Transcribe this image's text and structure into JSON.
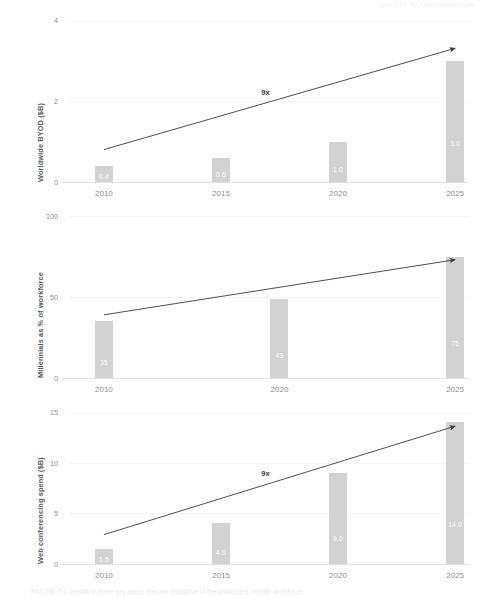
{
  "header": {
    "text": "DIGITAL TRANSFORMATION"
  },
  "caption": {
    "label": "FIGURE 7.1",
    "text": "FIGURE 7.1 Growth in three key areas that are indicative of the connected, mobile workforce."
  },
  "chart_data": [
    {
      "type": "bar",
      "title": "",
      "ylabel": "Worldwide BYOD ($B)",
      "xlabel": "",
      "categories": [
        "2010",
        "2015",
        "2020",
        "2025"
      ],
      "values": [
        0.4,
        0.6,
        1.0,
        3.0
      ],
      "value_labels": [
        "0.4",
        "0.6",
        "1.0",
        "3.0"
      ],
      "ylim": [
        0,
        4
      ],
      "yticks": [
        0,
        2,
        4
      ],
      "ytick_labels": [
        "0",
        "2",
        "4"
      ],
      "grid": true,
      "legend": "none",
      "annotation": {
        "label": "9x",
        "start": {
          "x": "2010",
          "y": 0.8
        },
        "end": {
          "x": "2025",
          "y": 3.3
        },
        "arrow": true
      },
      "bar_color": "#d2d2d3",
      "label_color": "#ffffff",
      "annotation_color": "#3b3b3d"
    },
    {
      "type": "bar",
      "title": "",
      "ylabel": "Millennials as % of workforce",
      "xlabel": "",
      "categories": [
        "2010",
        "2020",
        "2025"
      ],
      "values": [
        35,
        49,
        75
      ],
      "value_labels": [
        "35",
        "49",
        "75"
      ],
      "ylim": [
        0,
        100
      ],
      "yticks": [
        0,
        50,
        100
      ],
      "ytick_labels": [
        "0",
        "50",
        "100"
      ],
      "grid": true,
      "legend": "none",
      "annotation": {
        "label": "",
        "start": {
          "x": "2010",
          "y": 39
        },
        "end": {
          "x": "2025",
          "y": 73
        },
        "arrow": true
      },
      "bar_color": "#d2d2d3",
      "label_color": "#ffffff",
      "annotation_color": "#3b3b3d"
    },
    {
      "type": "bar",
      "title": "",
      "ylabel": "Web conferencing spend ($B)",
      "xlabel": "",
      "categories": [
        "2010",
        "2015",
        "2020",
        "2025"
      ],
      "values": [
        1.5,
        4.0,
        9.0,
        14.0
      ],
      "value_labels": [
        "1.5",
        "4.0",
        "9.0",
        "14.0"
      ],
      "ylim": [
        0,
        15
      ],
      "yticks": [
        0,
        5,
        10,
        15
      ],
      "ytick_labels": [
        "0",
        "5",
        "10",
        "15"
      ],
      "grid": true,
      "legend": "none",
      "annotation": {
        "label": "9x",
        "start": {
          "x": "2010",
          "y": 2.9
        },
        "end": {
          "x": "2025",
          "y": 13.6
        },
        "arrow": true
      },
      "bar_color": "#d2d2d3",
      "label_color": "#ffffff",
      "annotation_color": "#3b3b3d"
    }
  ]
}
